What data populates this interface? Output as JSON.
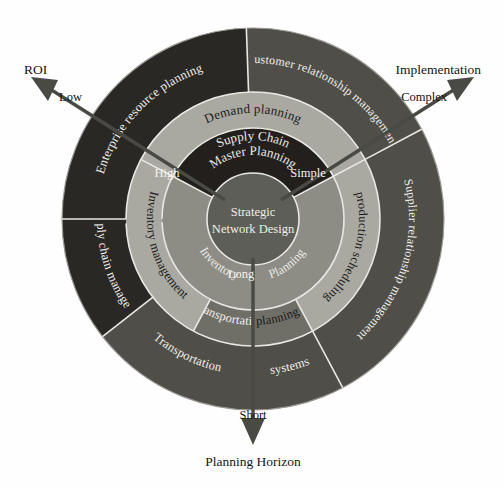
{
  "diagram": {
    "center": {
      "line1": "Strategic",
      "line2": "Network Design"
    },
    "inner_ring": {
      "top": "Supply Chain Master Planning",
      "top_line1": "Supply Chain",
      "top_line2": "Master Planning",
      "bottom_left": "Inventory",
      "bottom_right": "Planning"
    },
    "middle_ring": [
      {
        "label": "Demand planning",
        "position": "top"
      },
      {
        "label": "production scheduling",
        "position": "right"
      },
      {
        "label": "Transportation",
        "position": "bottom-left"
      },
      {
        "label": "planning",
        "position": "bottom-right"
      },
      {
        "label": "Inventory management",
        "position": "left"
      }
    ],
    "outer_ring": [
      {
        "label": "Enterprise resource planning",
        "position": "top-left"
      },
      {
        "label": "Customer relationship management",
        "position": "top-right"
      },
      {
        "label": "Supplier relationship management",
        "position": "right"
      },
      {
        "label": "Transportation",
        "position": "bottom-left"
      },
      {
        "label": "systems",
        "position": "bottom-right"
      },
      {
        "label": "Supply chain management",
        "position": "left"
      }
    ],
    "axes": [
      {
        "name": "ROI",
        "direction": "upper-left",
        "tip_value": "Low",
        "inner_value": "High"
      },
      {
        "name": "Implementation",
        "direction": "upper-right",
        "tip_value": "Complex",
        "inner_value": "Simple"
      },
      {
        "name": "Planning Horizon",
        "direction": "down",
        "tip_value": "Short",
        "inner_value": "Long"
      }
    ],
    "colors": {
      "background": "#fefefe",
      "core": "#5e5e58",
      "inner_ring_dark": "#221f1c",
      "inner_ring_mid": "#8d8d86",
      "middle_ring_light": "#a9a9a2",
      "middle_ring_mid": "#6f6f68",
      "outer_ring_dark": "#4f4e48",
      "outer_ring_darkest": "#2a2824",
      "separator": "#e9e7e2",
      "arrow": "#4a4a44",
      "text_light": "#f2f0ec",
      "text_dark": "#17160f"
    }
  }
}
